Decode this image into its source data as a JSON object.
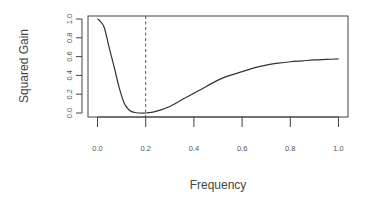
{
  "chart_data": {
    "type": "line",
    "title": "",
    "xlabel": "Frequency",
    "ylabel": "Squared Gain",
    "xlim": [
      0.0,
      1.0
    ],
    "ylim": [
      0.0,
      1.0
    ],
    "x_ticks": [
      "0.0",
      "0.2",
      "0.4",
      "0.6",
      "0.8",
      "1.0"
    ],
    "y_ticks": [
      "0.0",
      "0.2",
      "0.4",
      "0.6",
      "0.8",
      "1.0"
    ],
    "grid": false,
    "legend": null,
    "series": [
      {
        "name": "squared gain",
        "color": "#333333",
        "x": [
          0.0,
          0.01,
          0.028,
          0.048,
          0.069,
          0.09,
          0.11,
          0.125,
          0.138,
          0.155,
          0.17,
          0.2,
          0.23,
          0.26,
          0.3,
          0.35,
          0.4,
          0.45,
          0.5,
          0.55,
          0.6,
          0.65,
          0.7,
          0.75,
          0.8,
          0.85,
          0.9,
          0.95,
          1.0
        ],
        "y": [
          1.0,
          0.98,
          0.91,
          0.7,
          0.49,
          0.27,
          0.11,
          0.05,
          0.02,
          0.005,
          0.0,
          0.0,
          0.01,
          0.03,
          0.07,
          0.14,
          0.21,
          0.28,
          0.35,
          0.4,
          0.44,
          0.48,
          0.51,
          0.53,
          0.545,
          0.555,
          0.565,
          0.57,
          0.575
        ]
      }
    ],
    "annotations": [
      {
        "type": "vline",
        "x": 0.2,
        "style": "dashed",
        "color": "#555555"
      }
    ]
  }
}
